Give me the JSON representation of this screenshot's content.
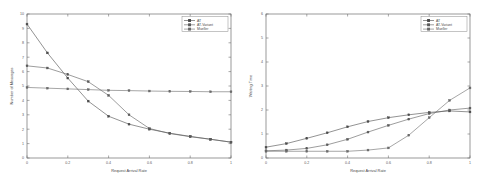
{
  "figure": {
    "panels": [
      "left",
      "right"
    ],
    "background": "#ffffff"
  },
  "colors": {
    "at": "#4a4a4a",
    "at_variant": "#5a5a5a",
    "mueller": "#6a6a6a",
    "axis": "#6e6e6e",
    "text": "#4a4a4a"
  },
  "chart_data": [
    {
      "type": "line",
      "title": "",
      "xlabel": "Request Arrival Rate",
      "ylabel": "Number of Messages",
      "xlim": [
        0,
        1
      ],
      "ylim": [
        0,
        10
      ],
      "xticks": [
        "0",
        "0.2",
        "0.4",
        "0.6",
        "0.8",
        "1"
      ],
      "xtick_values": [
        0,
        0.2,
        0.4,
        0.6,
        0.8,
        1
      ],
      "yticks": [
        "0",
        "1",
        "2",
        "3",
        "4",
        "5",
        "6",
        "7",
        "8",
        "9",
        "10"
      ],
      "ytick_values": [
        0,
        1,
        2,
        3,
        4,
        5,
        6,
        7,
        8,
        9,
        10
      ],
      "grid": false,
      "legend_position": "top-right",
      "x": [
        0,
        0.1,
        0.2,
        0.3,
        0.4,
        0.5,
        0.6,
        0.7,
        0.8,
        0.9,
        1
      ],
      "series": [
        {
          "name": "AT",
          "marker": "square",
          "values": [
            9.3,
            7.3,
            5.55,
            3.95,
            2.9,
            2.35,
            2.0,
            1.72,
            1.5,
            1.3,
            1.1
          ]
        },
        {
          "name": "AT-Variant",
          "marker": "square",
          "values": [
            6.4,
            6.25,
            5.8,
            5.3,
            4.35,
            3.0,
            2.05,
            1.7,
            1.48,
            1.3,
            1.1
          ]
        },
        {
          "name": "Mueller",
          "marker": "square",
          "values": [
            4.9,
            4.85,
            4.8,
            4.75,
            4.7,
            4.68,
            4.65,
            4.63,
            4.62,
            4.6,
            4.6
          ]
        }
      ]
    },
    {
      "type": "line",
      "title": "",
      "xlabel": "Request Arrival Rate",
      "ylabel": "Waiting Time",
      "xlim": [
        0,
        1
      ],
      "ylim": [
        0,
        6
      ],
      "xticks": [
        "0",
        "0.2",
        "0.4",
        "0.6",
        "0.8",
        "1"
      ],
      "xtick_values": [
        0,
        0.2,
        0.4,
        0.6,
        0.8,
        1
      ],
      "yticks": [
        "0",
        "1",
        "2",
        "3",
        "4",
        "5",
        "6"
      ],
      "ytick_values": [
        0,
        1,
        2,
        3,
        4,
        5,
        6
      ],
      "grid": false,
      "legend_position": "top-right",
      "x": [
        0,
        0.1,
        0.2,
        0.3,
        0.4,
        0.5,
        0.6,
        0.7,
        0.8,
        0.9,
        1
      ],
      "series": [
        {
          "name": "AT",
          "marker": "square",
          "values": [
            0.45,
            0.6,
            0.82,
            1.05,
            1.3,
            1.52,
            1.68,
            1.8,
            1.9,
            1.96,
            1.92
          ]
        },
        {
          "name": "AT-Variant",
          "marker": "square",
          "values": [
            0.3,
            0.33,
            0.4,
            0.55,
            0.78,
            1.08,
            1.36,
            1.62,
            1.85,
            2.0,
            2.08
          ]
        },
        {
          "name": "Mueller",
          "marker": "square",
          "values": [
            0.28,
            0.28,
            0.28,
            0.28,
            0.28,
            0.33,
            0.42,
            0.95,
            1.68,
            2.4,
            2.92
          ]
        }
      ]
    }
  ]
}
